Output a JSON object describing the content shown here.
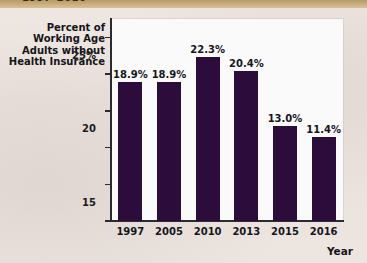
{
  "banner": {
    "text": "1997–2016"
  },
  "chart_data": {
    "type": "bar",
    "title": "",
    "xlabel": "Year",
    "ylabel": "Percent of Working Age Adults without Health Insurance",
    "ylabel_lines": [
      "Percent of",
      "Working Age",
      "Adults without",
      "Health Insurance"
    ],
    "categories": [
      "1997",
      "2005",
      "2010",
      "2013",
      "2015",
      "2016"
    ],
    "values": [
      18.9,
      18.9,
      22.3,
      20.4,
      13.0,
      11.4
    ],
    "value_labels": [
      "18.9%",
      "18.9%",
      "22.3%",
      "20.4%",
      "13.0%",
      "11.4%"
    ],
    "ylim": [
      0,
      27.5
    ],
    "yticks": [
      0,
      5,
      10,
      15,
      20,
      25
    ],
    "ytick_labels": [
      "0",
      "5",
      "10",
      "15",
      "20",
      "25%"
    ],
    "grid": false,
    "legend": null,
    "bar_color": "#2b0c3a",
    "plot_background": "#fbfafa",
    "page_background": "#ece4df",
    "banner_color": "#c9ab78"
  }
}
